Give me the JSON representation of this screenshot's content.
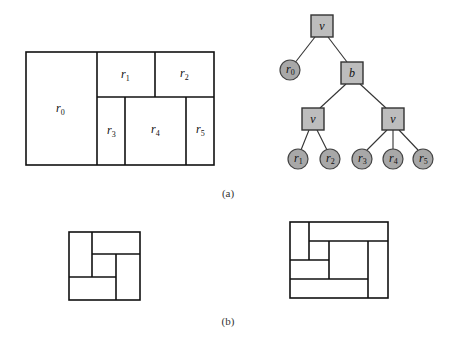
{
  "figure": {
    "part_a": {
      "caption": "(a)",
      "layout": {
        "regions": [
          {
            "id": "r0",
            "label": "r",
            "sub": "0"
          },
          {
            "id": "r1",
            "label": "r",
            "sub": "1"
          },
          {
            "id": "r2",
            "label": "r",
            "sub": "2"
          },
          {
            "id": "r3",
            "label": "r",
            "sub": "3"
          },
          {
            "id": "r4",
            "label": "r",
            "sub": "4"
          },
          {
            "id": "r5",
            "label": "r",
            "sub": "5"
          }
        ]
      },
      "tree": {
        "root": {
          "label": "v",
          "type": "internal"
        },
        "b_node": {
          "label": "b",
          "type": "internal"
        },
        "left_v": {
          "label": "v",
          "type": "internal"
        },
        "right_v": {
          "label": "v",
          "type": "internal"
        },
        "leaves": [
          {
            "label": "r",
            "sub": "0"
          },
          {
            "label": "r",
            "sub": "1"
          },
          {
            "label": "r",
            "sub": "2"
          },
          {
            "label": "r",
            "sub": "3"
          },
          {
            "label": "r",
            "sub": "4"
          },
          {
            "label": "r",
            "sub": "5"
          }
        ],
        "colors": {
          "node_fill": "#bdbdbd",
          "leaf_fill": "#a8a8a8",
          "stroke": "#333333"
        }
      }
    },
    "part_b": {
      "caption": "(b)",
      "shapes": [
        "pinwheel-5-rect",
        "spiral-7-rect"
      ]
    }
  }
}
